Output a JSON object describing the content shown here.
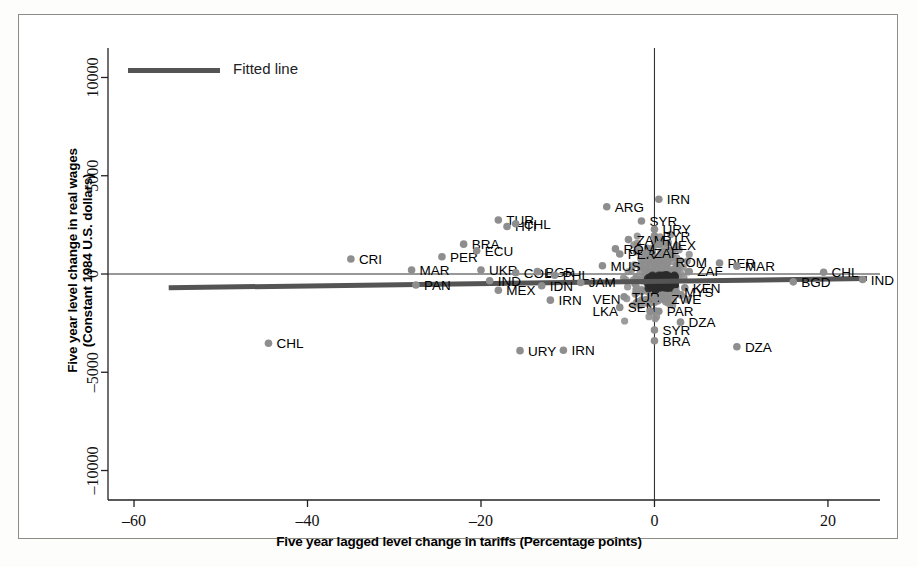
{
  "chart_data": {
    "type": "scatter",
    "title": "",
    "xlabel": "Five year lagged level change in tariffs (Percentage points)",
    "ylabel": "Five year level change in real wages\n(Constant 1984 U.S. dollars)",
    "ylabel_line1": "Five year level change in real wages",
    "ylabel_line2": "(Constant 1984 U.S. dollars)",
    "xlim": [
      -63,
      26
    ],
    "ylim": [
      -11500,
      11500
    ],
    "xticks": [
      -60,
      -40,
      -20,
      0,
      20
    ],
    "xtick_labels": [
      "–60",
      "–40",
      "–20",
      "0",
      "20"
    ],
    "yticks": [
      -10000,
      -5000,
      0,
      5000,
      10000
    ],
    "ytick_labels": [
      "–10000",
      "–5000",
      "0",
      "5000",
      "10000"
    ],
    "grid": false,
    "legend": {
      "position": "top-left",
      "entries": [
        {
          "label": "Fitted line",
          "color": "#545454",
          "type": "line"
        }
      ]
    },
    "marker_color": "#8e8e8e",
    "reference_lines": [
      {
        "axis": "y",
        "value": 0,
        "color": "#333333"
      },
      {
        "axis": "x",
        "value": 0,
        "color": "#333333"
      }
    ],
    "fitted_line": {
      "x": [
        -56,
        24.5
      ],
      "y": [
        -700,
        -230
      ],
      "color": "#545454",
      "label": "Fitted line"
    },
    "points": [
      {
        "label": "CRI",
        "x": -35.0,
        "y": 760,
        "lx": 8,
        "ly": 0
      },
      {
        "label": "MAR",
        "x": -28.0,
        "y": 200,
        "lx": 8,
        "ly": 0
      },
      {
        "label": "PAN",
        "x": -27.5,
        "y": -560,
        "lx": 8,
        "ly": 0
      },
      {
        "label": "PER",
        "x": -24.5,
        "y": 880,
        "lx": 8,
        "ly": 0
      },
      {
        "label": "BRA",
        "x": -22.0,
        "y": 1520,
        "lx": 8,
        "ly": 0
      },
      {
        "label": "ECU",
        "x": -20.5,
        "y": 1180,
        "lx": 8,
        "ly": 0
      },
      {
        "label": "UKR",
        "x": -20.0,
        "y": 200,
        "lx": 8,
        "ly": 0
      },
      {
        "label": "IND",
        "x": -19.0,
        "y": -340,
        "lx": 8,
        "ly": 0
      },
      {
        "label": "MEX",
        "x": -18.0,
        "y": -830,
        "lx": 8,
        "ly": 0
      },
      {
        "label": "TUR",
        "x": -18.0,
        "y": 2750,
        "lx": 8,
        "ly": 0
      },
      {
        "label": "HTI",
        "x": -17.0,
        "y": 2420,
        "lx": 8,
        "ly": 0
      },
      {
        "label": "CHL",
        "x": -16.0,
        "y": 2560,
        "lx": 8,
        "ly": 0
      },
      {
        "label": "COL",
        "x": -16.0,
        "y": 60,
        "lx": 8,
        "ly": 0
      },
      {
        "label": "BGR",
        "x": -13.5,
        "y": 120,
        "lx": 8,
        "ly": 0
      },
      {
        "label": "IDN",
        "x": -13.0,
        "y": -600,
        "lx": 8,
        "ly": 0
      },
      {
        "label": "PHL",
        "x": -11.5,
        "y": -60,
        "lx": 8,
        "ly": 0
      },
      {
        "label": "IRN",
        "x": -12.0,
        "y": -1330,
        "lx": 8,
        "ly": 0
      },
      {
        "label": "JAM",
        "x": -8.5,
        "y": -430,
        "lx": 8,
        "ly": 0
      },
      {
        "label": "URY",
        "x": -15.5,
        "y": -3900,
        "lx": 8,
        "ly": 0
      },
      {
        "label": "IRN",
        "x": -10.5,
        "y": -3880,
        "lx": 8,
        "ly": 0
      },
      {
        "label": "CHL",
        "x": -44.5,
        "y": -3520,
        "lx": 8,
        "ly": 0
      },
      {
        "label": "ARG",
        "x": -5.5,
        "y": 3420,
        "lx": 8,
        "ly": 0
      },
      {
        "label": "IRN",
        "x": 0.5,
        "y": 3800,
        "lx": 8,
        "ly": 0
      },
      {
        "label": "SYR",
        "x": -1.5,
        "y": 2700,
        "lx": 8,
        "ly": 0
      },
      {
        "label": "URY",
        "x": 0.0,
        "y": 2280,
        "lx": 8,
        "ly": 0
      },
      {
        "label": "BYR",
        "x": 0.0,
        "y": 1940,
        "lx": 8,
        "ly": 0
      },
      {
        "label": "ZAM",
        "x": -3.0,
        "y": 1750,
        "lx": 8,
        "ly": 0
      },
      {
        "label": "MEX",
        "x": 0.5,
        "y": 1500,
        "lx": 8,
        "ly": 0
      },
      {
        "label": "ROM",
        "x": -4.5,
        "y": 1280,
        "lx": 8,
        "ly": 0
      },
      {
        "label": "PER",
        "x": -4.0,
        "y": 1020,
        "lx": 8,
        "ly": 0
      },
      {
        "label": "ZAF",
        "x": -1.0,
        "y": 1050,
        "lx": 8,
        "ly": 0
      },
      {
        "label": "MUS",
        "x": -6.0,
        "y": 420,
        "lx": 8,
        "ly": 0
      },
      {
        "label": "ROM",
        "x": 1.5,
        "y": 600,
        "lx": 8,
        "ly": 0
      },
      {
        "label": "ZAF",
        "x": 4.0,
        "y": 130,
        "lx": 8,
        "ly": 0
      },
      {
        "label": "PER",
        "x": 7.5,
        "y": 560,
        "lx": 8,
        "ly": 0
      },
      {
        "label": "MAR",
        "x": 9.5,
        "y": 400,
        "lx": 8,
        "ly": 0
      },
      {
        "label": "CHL",
        "x": 19.5,
        "y": 90,
        "lx": 8,
        "ly": 0
      },
      {
        "label": "BGD",
        "x": 16.0,
        "y": -400,
        "lx": 8,
        "ly": 0
      },
      {
        "label": "IND",
        "x": 24.0,
        "y": -280,
        "lx": 8,
        "ly": 0
      },
      {
        "label": "KEN",
        "x": 3.5,
        "y": -700,
        "lx": 8,
        "ly": 0
      },
      {
        "label": "MYS",
        "x": 2.5,
        "y": -900,
        "lx": 8,
        "ly": 0
      },
      {
        "label": "TUR",
        "x": -3.5,
        "y": -1160,
        "lx": 8,
        "ly": 0
      },
      {
        "label": "ZWE",
        "x": 1.0,
        "y": -1280,
        "lx": 8,
        "ly": 0
      },
      {
        "label": "VEN",
        "x": 0.0,
        "y": -1280,
        "lx": -34,
        "ly": 0
      },
      {
        "label": "SEN",
        "x": -4.0,
        "y": -1700,
        "lx": 8,
        "ly": 0
      },
      {
        "label": "PAR",
        "x": 0.5,
        "y": -1900,
        "lx": 8,
        "ly": 0
      },
      {
        "label": "LKA",
        "x": -0.5,
        "y": -1900,
        "lx": -32,
        "ly": 0
      },
      {
        "label": "DZA",
        "x": 3.0,
        "y": -2450,
        "lx": 8,
        "ly": 0
      },
      {
        "label": "SYR",
        "x": 0.0,
        "y": -2850,
        "lx": 8,
        "ly": 0
      },
      {
        "label": "BRA",
        "x": 0.0,
        "y": -3400,
        "lx": 8,
        "ly": 0
      },
      {
        "label": "DZA",
        "x": 9.5,
        "y": -3700,
        "lx": 8,
        "ly": 0
      }
    ],
    "cluster_note": "Dense overlapping mass of unlabeled country markers near x=0, y=0"
  }
}
